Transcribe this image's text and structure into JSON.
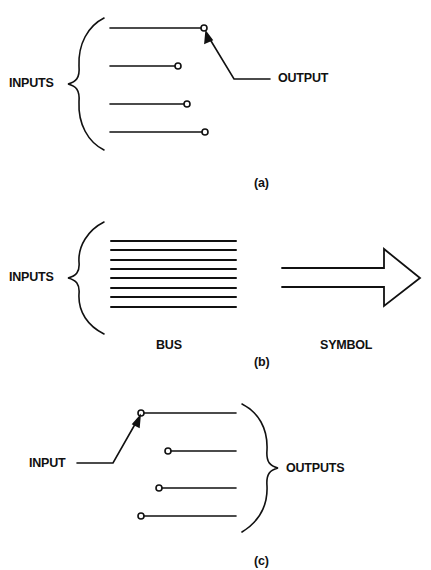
{
  "panel_a": {
    "inputs_label": "INPUTS",
    "output_label": "OUTPUT",
    "caption": "(a)",
    "lines": [
      {
        "y": 28,
        "x1": 110,
        "x2": 204
      },
      {
        "y": 66,
        "x1": 110,
        "x2": 178
      },
      {
        "y": 104,
        "x1": 110,
        "x2": 187
      },
      {
        "y": 132,
        "x1": 110,
        "x2": 205
      }
    ]
  },
  "panel_b": {
    "inputs_label": "INPUTS",
    "bus_label": "BUS",
    "symbol_label": "SYMBOL",
    "caption": "(b)",
    "bus_line_count": 8
  },
  "panel_c": {
    "input_label": "INPUT",
    "outputs_label": "OUTPUTS",
    "caption": "(c)"
  },
  "colors": {
    "stroke": "#111111",
    "background": "#ffffff"
  }
}
